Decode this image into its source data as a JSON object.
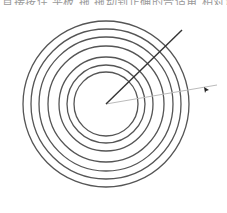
{
  "header": {
    "clipped_text": "直接按住  平板  拖  拖动到正确的合适角  相对角度"
  },
  "diagram": {
    "center": {
      "x": 106,
      "y": 104
    },
    "ring_radii": [
      83,
      75,
      67,
      58,
      47,
      39,
      32
    ],
    "ring_color": "#555555",
    "dark_ray": {
      "x1": 106,
      "y1": 104,
      "x2": 182,
      "y2": 30,
      "color": "#333333"
    },
    "light_ray": {
      "x1": 106,
      "y1": 104,
      "x2": 217,
      "y2": 85,
      "color": "#bbbbbb"
    },
    "cursor_marker": {
      "x": 206,
      "y": 90,
      "color": "#222222"
    }
  }
}
